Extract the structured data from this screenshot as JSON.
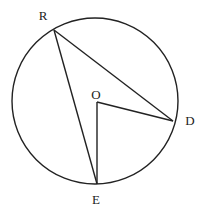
{
  "figure": {
    "type": "circle-geometry",
    "circle": {
      "center": "O",
      "cx": 95,
      "cy": 101,
      "r": 83
    },
    "points": [
      {
        "id": "R",
        "label": "R",
        "x": 54,
        "y": 30,
        "label_x": 43,
        "label_y": 20
      },
      {
        "id": "D",
        "label": "D",
        "x": 173,
        "y": 121,
        "label_x": 190,
        "label_y": 125
      },
      {
        "id": "E",
        "label": "E",
        "x": 97,
        "y": 184,
        "label_x": 96,
        "label_y": 204
      },
      {
        "id": "O",
        "label": "O",
        "x": 97,
        "y": 102,
        "label_x": 96,
        "label_y": 99
      }
    ],
    "segments": [
      {
        "name": "RD",
        "from": "R",
        "to": "D"
      },
      {
        "name": "RE",
        "from": "R",
        "to": "E"
      },
      {
        "name": "OD",
        "from": "O",
        "to": "D"
      },
      {
        "name": "OE",
        "from": "O",
        "to": "E"
      }
    ],
    "stroke_color": "#222222",
    "background": "#ffffff"
  }
}
